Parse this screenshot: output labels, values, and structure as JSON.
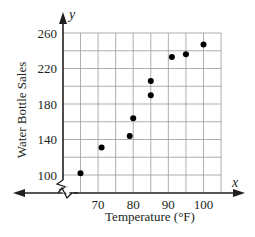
{
  "chart_data": {
    "type": "scatter",
    "title": "",
    "xlabel": "Temperature (°F)",
    "ylabel": "Water Bottle Sales",
    "x_axis_letter": "x",
    "y_axis_letter": "y",
    "xlim": [
      60,
      105
    ],
    "ylim": [
      100,
      260
    ],
    "x_ticks": [
      70,
      80,
      90,
      100
    ],
    "y_ticks": [
      100,
      140,
      180,
      220,
      260
    ],
    "x_tick_labels": [
      "70",
      "80",
      "90",
      "100"
    ],
    "y_tick_labels": [
      "100",
      "140",
      "180",
      "220",
      "260"
    ],
    "grid": true,
    "grid_x_step": 5,
    "grid_y_step": 20,
    "axis_break": true,
    "legend": null,
    "points": [
      {
        "x": 65,
        "y": 102
      },
      {
        "x": 71,
        "y": 131
      },
      {
        "x": 79,
        "y": 144
      },
      {
        "x": 80,
        "y": 164
      },
      {
        "x": 85,
        "y": 190
      },
      {
        "x": 85,
        "y": 206
      },
      {
        "x": 91,
        "y": 233
      },
      {
        "x": 95,
        "y": 236
      },
      {
        "x": 100,
        "y": 247
      }
    ],
    "colors": {
      "points": "#000000",
      "grid": "#9a9a9a",
      "axis": "#231f20"
    }
  }
}
